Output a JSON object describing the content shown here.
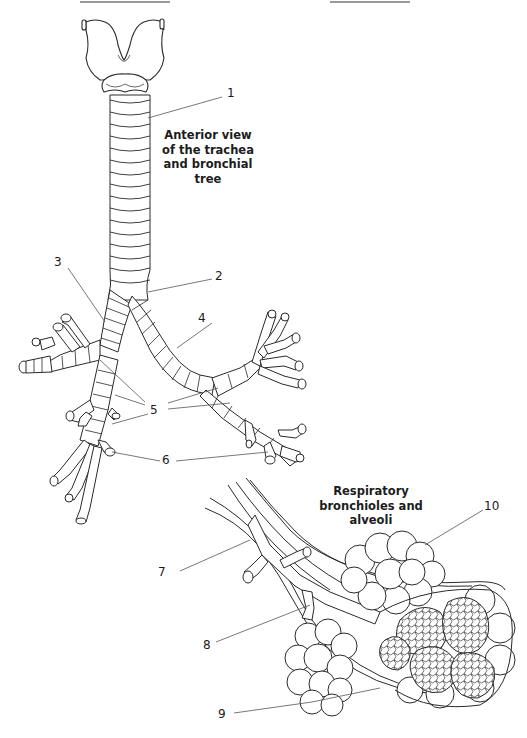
{
  "figure": {
    "title_top": {
      "lines": [
        "Anterior view",
        "of the trachea",
        "and bronchial",
        "tree"
      ]
    },
    "title_bottom": {
      "lines": [
        "Respiratory",
        "bronchioles and",
        "alveoli"
      ]
    }
  },
  "labels": [
    {
      "id": "1",
      "text": "1"
    },
    {
      "id": "2",
      "text": "2"
    },
    {
      "id": "3",
      "text": "3"
    },
    {
      "id": "4",
      "text": "4"
    },
    {
      "id": "5",
      "text": "5"
    },
    {
      "id": "6",
      "text": "6"
    },
    {
      "id": "7",
      "text": "7"
    },
    {
      "id": "8",
      "text": "8"
    },
    {
      "id": "9",
      "text": "9"
    },
    {
      "id": "10",
      "text": "10"
    }
  ],
  "colors": {
    "line": "#2a2a2a",
    "leader": "#555555",
    "fill": "#ffffff",
    "text": "#1a1a1a"
  }
}
